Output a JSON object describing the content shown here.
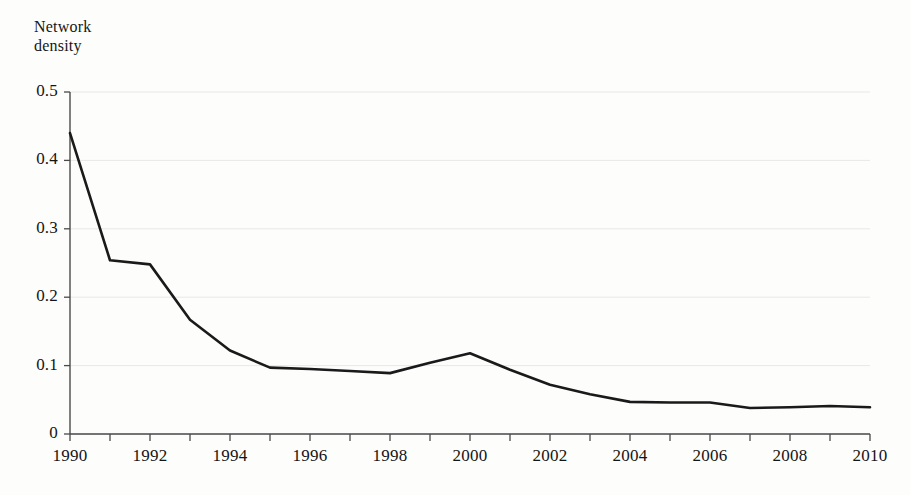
{
  "chart_data": {
    "type": "line",
    "title": "",
    "ylabel": "Network density",
    "ylabel_lines": [
      "Network",
      "density"
    ],
    "xlabel": "",
    "x": [
      1990,
      1991,
      1992,
      1993,
      1994,
      1995,
      1996,
      1997,
      1998,
      1999,
      2000,
      2001,
      2002,
      2003,
      2004,
      2005,
      2006,
      2007,
      2008,
      2009,
      2010
    ],
    "values": [
      0.44,
      0.254,
      0.248,
      0.167,
      0.122,
      0.097,
      0.095,
      0.092,
      0.089,
      0.104,
      0.118,
      0.094,
      0.072,
      0.058,
      0.047,
      0.046,
      0.046,
      0.038,
      0.039,
      0.041,
      0.039
    ],
    "series": [
      {
        "name": "Network density",
        "values": [
          0.44,
          0.254,
          0.248,
          0.167,
          0.122,
          0.097,
          0.095,
          0.092,
          0.089,
          0.104,
          0.118,
          0.094,
          0.072,
          0.058,
          0.047,
          0.046,
          0.046,
          0.038,
          0.039,
          0.041,
          0.039
        ],
        "color": "#1a1a1a"
      }
    ],
    "xlim": [
      1990,
      2010
    ],
    "ylim": [
      0,
      0.5
    ],
    "ytick_values": [
      0,
      0.1,
      0.2,
      0.3,
      0.4,
      0.5
    ],
    "ytick_labels": [
      "0",
      "0.1",
      "0.2",
      "0.3",
      "0.4",
      "0.5"
    ],
    "xtick_values": [
      1990,
      1991,
      1992,
      1993,
      1994,
      1995,
      1996,
      1997,
      1998,
      1999,
      2000,
      2001,
      2002,
      2003,
      2004,
      2005,
      2006,
      2007,
      2008,
      2009,
      2010
    ],
    "xtick_labels": [
      "1990",
      "",
      "1992",
      "",
      "1994",
      "",
      "1996",
      "",
      "1998",
      "",
      "2000",
      "",
      "2002",
      "",
      "2004",
      "",
      "2006",
      "",
      "2008",
      "",
      "2010"
    ],
    "grid": "horizontal",
    "grid_color": "#e8e8e6",
    "legend": "none",
    "axis_color": "#4a4a4a",
    "line_color": "#1a1a1a",
    "line_width": 2.6,
    "background": "#fdfdfc"
  }
}
